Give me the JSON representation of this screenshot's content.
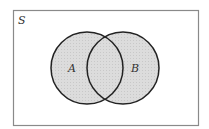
{
  "diagram": {
    "type": "venn",
    "universe_label": "S",
    "sets": [
      {
        "label": "A",
        "cx": 87,
        "cy": 68,
        "r": 36
      },
      {
        "label": "B",
        "cx": 123,
        "cy": 68,
        "r": 36
      }
    ],
    "colors": {
      "fill": "#dcdcdc",
      "stroke": "#222222",
      "frame": "#8a8a8a",
      "background": "#ffffff"
    }
  }
}
